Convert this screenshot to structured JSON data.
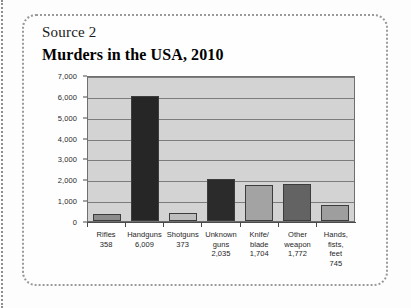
{
  "source_label": "Source 2",
  "colors": {
    "plot_background": "#d3d3d3",
    "gridline": "#7d7d7d",
    "axis": "#4a4a4a",
    "card_border": "#9a9a9a"
  },
  "chart_data": {
    "type": "bar",
    "title": "Murders in the USA, 2010",
    "xlabel": "",
    "ylabel": "",
    "ylim": [
      0,
      7000
    ],
    "ytick_labels": [
      "0",
      "1,000",
      "2,000",
      "3,000",
      "4,000",
      "5,000",
      "6,000",
      "7,000"
    ],
    "ytick_values": [
      0,
      1000,
      2000,
      3000,
      4000,
      5000,
      6000,
      7000
    ],
    "grid": true,
    "legend": "none",
    "categories": [
      "Rifles",
      "Handguns",
      "Shotguns",
      "Unknown guns",
      "Knife/ blade",
      "Other weapon",
      "Hands, fists, feet"
    ],
    "category_lines": [
      [
        "Rifles"
      ],
      [
        "Handguns"
      ],
      [
        "Shotguns"
      ],
      [
        "Unknown",
        "guns"
      ],
      [
        "Knife/",
        "blade"
      ],
      [
        "Other",
        "weapon"
      ],
      [
        "Hands,",
        "fists,",
        "feet"
      ]
    ],
    "values": [
      358,
      6009,
      373,
      2035,
      1704,
      1772,
      745
    ],
    "value_labels": [
      "358",
      "6,009",
      "373",
      "2,035",
      "1,704",
      "1,772",
      "745"
    ],
    "bar_colors": [
      "#8c8c8c",
      "#262626",
      "#bdbdbd",
      "#2b2b2b",
      "#a3a3a3",
      "#636363",
      "#9e9e9e"
    ]
  }
}
